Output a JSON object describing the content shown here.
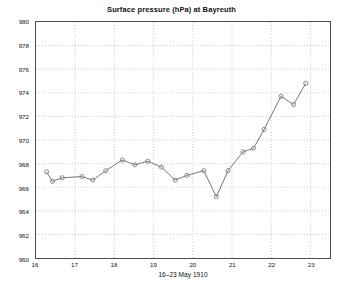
{
  "figure": {
    "title": "Surface pressure (hPa) at Bayreuth",
    "background_color": "#ffffff",
    "axis_color": "#4d4d4d",
    "grid_color": "#b0b0b0",
    "line_color": "#666666",
    "marker_color": "#808080"
  },
  "axes": {
    "xlabel": "16–23 May 1910",
    "ylabel": "",
    "xticks": [
      "16",
      "17",
      "18",
      "19",
      "20",
      "21",
      "22",
      "23"
    ],
    "yticks": [
      "960",
      "962",
      "964",
      "966",
      "968",
      "970",
      "972",
      "974",
      "976",
      "978",
      "980"
    ],
    "xlim": [
      16,
      23.5
    ],
    "ylim": [
      960,
      980
    ],
    "grid": "on",
    "grid_style": "dotted"
  },
  "chart_data": {
    "type": "line",
    "title": "Surface pressure (hPa) at Bayreuth",
    "xlabel": "16–23 May 1910",
    "ylabel": "",
    "xlim": [
      16,
      23.5
    ],
    "ylim": [
      960,
      980
    ],
    "grid": true,
    "legend": null,
    "marker": "circle",
    "x": [
      16.27,
      16.4,
      16.65,
      17.15,
      17.4,
      17.65,
      18.05,
      18.3,
      18.55,
      18.9,
      19.15,
      19.55,
      19.85,
      20.3,
      20.6,
      20.9,
      21.25,
      21.55,
      21.85,
      22.25,
      22.55,
      22.85
    ],
    "values": [
      967.3,
      966.5,
      966.8,
      966.9,
      966.6,
      967.4,
      968.3,
      967.9,
      968.2,
      967.7,
      966.6,
      967.0,
      967.4,
      965.2,
      967.4,
      969.0,
      969.3,
      970.9,
      973.7,
      973.0,
      974.8,
      974.8
    ],
    "series": [
      {
        "name": "Surface pressure",
        "points": [
          {
            "x": 16.27,
            "y": 967.3
          },
          {
            "x": 16.42,
            "y": 966.5
          },
          {
            "x": 16.67,
            "y": 966.8
          },
          {
            "x": 17.17,
            "y": 966.9
          },
          {
            "x": 17.45,
            "y": 966.6
          },
          {
            "x": 17.78,
            "y": 967.4
          },
          {
            "x": 18.2,
            "y": 968.3
          },
          {
            "x": 18.52,
            "y": 967.9
          },
          {
            "x": 18.85,
            "y": 968.2
          },
          {
            "x": 19.2,
            "y": 967.7
          },
          {
            "x": 19.55,
            "y": 966.6
          },
          {
            "x": 19.85,
            "y": 967.0
          },
          {
            "x": 20.28,
            "y": 967.4
          },
          {
            "x": 20.6,
            "y": 965.2
          },
          {
            "x": 20.9,
            "y": 967.4
          },
          {
            "x": 21.28,
            "y": 969.0
          },
          {
            "x": 21.55,
            "y": 969.3
          },
          {
            "x": 21.82,
            "y": 970.9
          },
          {
            "x": 22.25,
            "y": 973.7
          },
          {
            "x": 22.57,
            "y": 973.0
          },
          {
            "x": 22.88,
            "y": 974.8
          }
        ]
      }
    ]
  }
}
